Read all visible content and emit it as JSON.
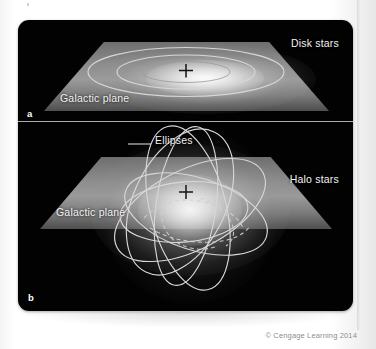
{
  "figure": {
    "copyright": "© Cengage Learning 2014",
    "colors": {
      "background": "#fdfdfd",
      "figure_background": "#020202",
      "orbit_stroke": "#d7d7d7",
      "label_text": "#f2f2f2",
      "plane_fill": "#8e8e8e",
      "divider": "#c9c9c9",
      "copyright_text": "#8e8e8e"
    },
    "panels": [
      {
        "letter": "a",
        "subject": "Disk stars",
        "labels": {
          "stars": "Disk stars",
          "plane": "Galactic plane"
        },
        "orbit_count": 2,
        "orbit_style": "circular-coplanar",
        "center_marker": "galactic-center-cross"
      },
      {
        "letter": "b",
        "subject": "Halo stars",
        "labels": {
          "stars": "Halo stars",
          "plane": "Galactic plane",
          "ellipses": "Ellipses"
        },
        "orbit_count": 6,
        "orbit_style": "randomly-inclined-ellipses",
        "center_marker": "galactic-center-cross"
      }
    ]
  }
}
